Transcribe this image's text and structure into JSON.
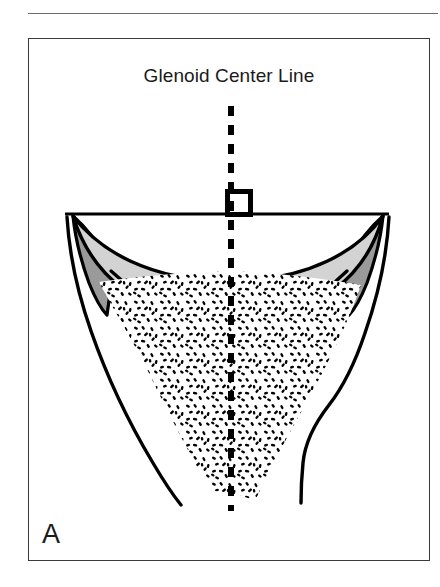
{
  "page": {
    "background_color": "#ffffff",
    "width": 440,
    "height": 587
  },
  "top_rule": {
    "name": "section-divider-rule",
    "color": "#6e6e6e"
  },
  "figure": {
    "title": "Glenoid Center Line",
    "panel_label": "A",
    "border_color": "#3a3a3a",
    "background_color": "#ffffff"
  },
  "illustration": {
    "type": "anatomical-line-drawing",
    "subject": "glenoid (scapula) coronal cross-section",
    "colors": {
      "outline": "#000000",
      "cartilage_light_gray": "#d3d3d3",
      "labrum_dark_gray": "#9a9a9a",
      "trabecular_stipple": "#000000",
      "center_line": "#000000",
      "face_line": "#000000"
    },
    "elements": [
      {
        "name": "glenoid-face-line",
        "description": "horizontal reference line across the glenoid face",
        "x_start": 36,
        "x_end": 360,
        "y": 175
      },
      {
        "name": "glenoid-center-line",
        "description": "vertical dashed line perpendicular to the glenoid face",
        "x": 202,
        "y_start": 67,
        "y_end": 472,
        "dash_length": 10,
        "dash_gap": 9,
        "stroke_width": 6
      },
      {
        "name": "right-angle-marker",
        "description": "square perpendicularity symbol at intersection of center line and face line",
        "x": 198,
        "y": 153,
        "size": 23,
        "stroke_width": 5
      },
      {
        "name": "articular-cartilage-band",
        "description": "light gray concave crescent representing articular cartilage"
      },
      {
        "name": "labrum-wedge-left",
        "description": "dark gray triangular wedge at the left glenoid rim"
      },
      {
        "name": "labrum-wedge-right",
        "description": "dark gray triangular wedge at the right glenoid rim"
      },
      {
        "name": "glenoid-bone-body",
        "description": "funnel shaped cortical outline of the glenoid vault narrowing to the scapular neck"
      },
      {
        "name": "trabecular-bone-stipple",
        "description": "triangular stippled region representing cancellous/trabecular bone"
      }
    ]
  }
}
